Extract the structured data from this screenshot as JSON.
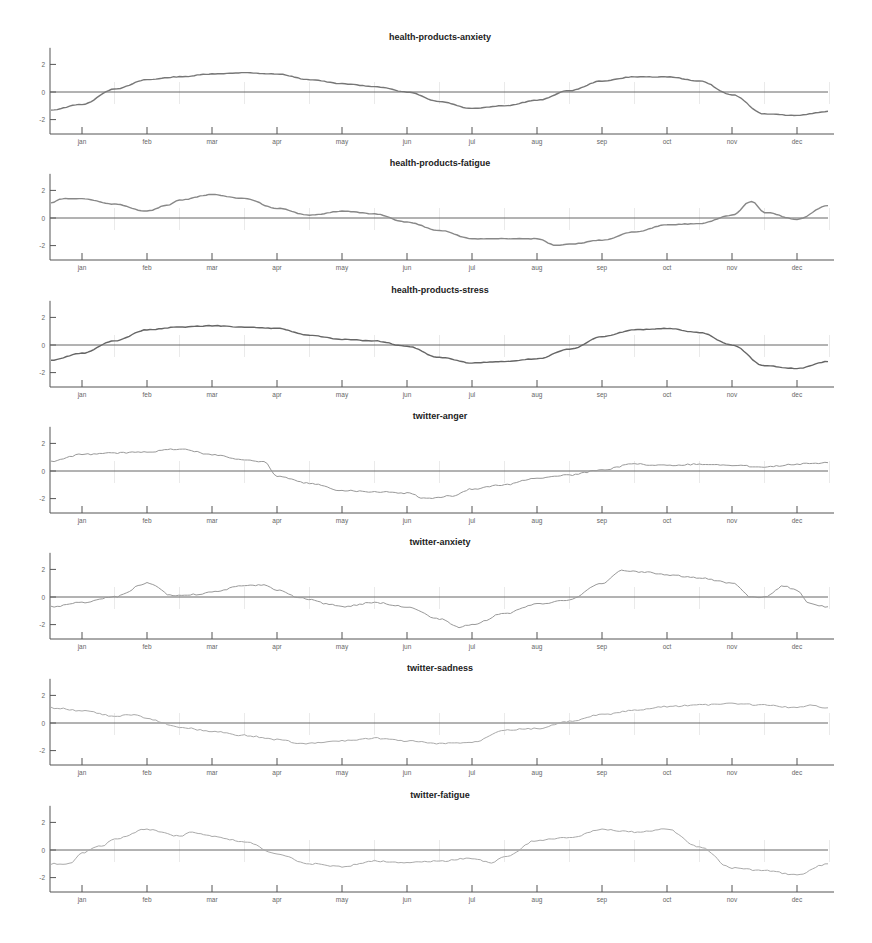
{
  "chart_data": [
    {
      "type": "line",
      "title": "health-products-anxiety",
      "xlabel": "",
      "ylabel": "",
      "ylim": [
        -3,
        3
      ],
      "yticks": [
        2,
        0,
        -2
      ],
      "categories": [
        "jan",
        "feb",
        "mar",
        "apr",
        "may",
        "jun",
        "jul",
        "aug",
        "sep",
        "oct",
        "nov",
        "dec"
      ],
      "line_color": "#777777",
      "x": [
        -0.5,
        0,
        0.5,
        1,
        1.5,
        2,
        2.5,
        3,
        3.5,
        4,
        4.5,
        5,
        5.5,
        6,
        6.5,
        7,
        7.5,
        8,
        8.5,
        9,
        9.5,
        10,
        10.5,
        11,
        11.5
      ],
      "values": [
        -1.3,
        -0.9,
        0.2,
        0.9,
        1.1,
        1.3,
        1.4,
        1.3,
        0.9,
        0.6,
        0.4,
        0.0,
        -0.7,
        -1.2,
        -1.0,
        -0.6,
        0.1,
        0.8,
        1.1,
        1.1,
        0.8,
        -0.2,
        -1.6,
        -1.7,
        -1.4
      ],
      "grid": false,
      "zero_line": true
    },
    {
      "type": "line",
      "title": "health-products-fatigue",
      "xlabel": "",
      "ylabel": "",
      "ylim": [
        -3,
        3
      ],
      "yticks": [
        2,
        0,
        -2
      ],
      "categories": [
        "jan",
        "feb",
        "mar",
        "apr",
        "may",
        "jun",
        "jul",
        "aug",
        "sep",
        "oct",
        "nov",
        "dec"
      ],
      "line_color": "#888888",
      "x": [
        -0.5,
        -0.3,
        0,
        0.5,
        1,
        1.3,
        1.5,
        2,
        2.5,
        3,
        3.5,
        4,
        4.5,
        5,
        5.5,
        6,
        6.5,
        7,
        7.3,
        7.5,
        8,
        8.5,
        9,
        9.5,
        10,
        10.3,
        10.5,
        11,
        11.5
      ],
      "values": [
        1.1,
        1.4,
        1.4,
        1.0,
        0.5,
        0.9,
        1.3,
        1.7,
        1.4,
        0.7,
        0.2,
        0.5,
        0.3,
        -0.3,
        -0.9,
        -1.5,
        -1.5,
        -1.5,
        -2.0,
        -1.9,
        -1.6,
        -1.0,
        -0.5,
        -0.4,
        0.2,
        1.2,
        0.4,
        -0.1,
        0.9
      ],
      "grid": false,
      "zero_line": true
    },
    {
      "type": "line",
      "title": "health-products-stress",
      "xlabel": "",
      "ylabel": "",
      "ylim": [
        -3,
        3
      ],
      "yticks": [
        2,
        0,
        -2
      ],
      "categories": [
        "jan",
        "feb",
        "mar",
        "apr",
        "may",
        "jun",
        "jul",
        "aug",
        "sep",
        "oct",
        "nov",
        "dec"
      ],
      "line_color": "#666666",
      "x": [
        -0.5,
        0,
        0.5,
        1,
        1.5,
        2,
        2.5,
        3,
        3.5,
        4,
        4.5,
        5,
        5.5,
        6,
        6.5,
        7,
        7.5,
        8,
        8.5,
        9,
        9.5,
        10,
        10.5,
        11,
        11.5
      ],
      "values": [
        -1.1,
        -0.6,
        0.3,
        1.1,
        1.3,
        1.4,
        1.3,
        1.2,
        0.7,
        0.4,
        0.3,
        -0.1,
        -0.9,
        -1.3,
        -1.2,
        -1.0,
        -0.3,
        0.6,
        1.1,
        1.2,
        0.9,
        0.0,
        -1.5,
        -1.7,
        -1.2
      ],
      "grid": false,
      "zero_line": true
    },
    {
      "type": "line",
      "title": "twitter-anger",
      "xlabel": "",
      "ylabel": "",
      "ylim": [
        -3,
        3
      ],
      "yticks": [
        2,
        0,
        -2
      ],
      "categories": [
        "jan",
        "feb",
        "mar",
        "apr",
        "may",
        "jun",
        "jul",
        "aug",
        "sep",
        "oct",
        "nov",
        "dec"
      ],
      "line_color": "#999999",
      "x": [
        -0.5,
        0,
        0.5,
        1,
        1.5,
        2,
        2.5,
        2.8,
        3,
        3.5,
        4,
        4.5,
        5,
        5.3,
        5.7,
        6,
        6.5,
        7,
        7.5,
        8,
        8.5,
        9,
        9.5,
        10,
        10.5,
        11,
        11.5
      ],
      "values": [
        0.7,
        1.2,
        1.3,
        1.4,
        1.6,
        1.2,
        0.8,
        0.7,
        -0.4,
        -0.9,
        -1.4,
        -1.5,
        -1.6,
        -2.0,
        -1.8,
        -1.3,
        -1.0,
        -0.5,
        -0.3,
        0.1,
        0.5,
        0.4,
        0.5,
        0.4,
        0.3,
        0.5,
        0.6
      ],
      "grid": false,
      "zero_line": true
    },
    {
      "type": "line",
      "title": "twitter-anxiety",
      "xlabel": "",
      "ylabel": "",
      "ylim": [
        -3,
        3
      ],
      "yticks": [
        2,
        0,
        -2
      ],
      "categories": [
        "jan",
        "feb",
        "mar",
        "apr",
        "may",
        "jun",
        "jul",
        "aug",
        "sep",
        "oct",
        "nov",
        "dec"
      ],
      "line_color": "#999999",
      "x": [
        -0.5,
        0,
        0.5,
        1,
        1.4,
        1.8,
        2,
        2.5,
        2.8,
        3,
        3.4,
        3.8,
        4,
        4.5,
        5,
        5.5,
        5.8,
        6,
        6.5,
        7,
        7.5,
        8,
        8.3,
        8.7,
        9,
        9.5,
        10,
        10.3,
        10.5,
        10.8,
        11,
        11.2,
        11.5
      ],
      "values": [
        -0.7,
        -0.4,
        0.0,
        1.0,
        0.1,
        0.2,
        0.4,
        0.8,
        0.9,
        0.5,
        -0.1,
        -0.5,
        -0.7,
        -0.4,
        -0.7,
        -1.6,
        -2.2,
        -2.0,
        -1.2,
        -0.5,
        -0.2,
        1.0,
        1.9,
        1.8,
        1.6,
        1.4,
        1.0,
        0.0,
        0.0,
        0.8,
        0.5,
        -0.5,
        -0.7
      ],
      "grid": false,
      "zero_line": true
    },
    {
      "type": "line",
      "title": "twitter-sadness",
      "xlabel": "",
      "ylabel": "",
      "ylim": [
        -3,
        3
      ],
      "yticks": [
        2,
        0,
        -2
      ],
      "categories": [
        "jan",
        "feb",
        "mar",
        "apr",
        "may",
        "jun",
        "jul",
        "aug",
        "sep",
        "oct",
        "nov",
        "dec"
      ],
      "line_color": "#aaaaaa",
      "x": [
        -0.5,
        0,
        0.5,
        0.8,
        1,
        1.5,
        2,
        2.5,
        3,
        3.4,
        4,
        4.5,
        5,
        5.5,
        6,
        6.5,
        7,
        7.5,
        8,
        8.5,
        9,
        9.5,
        10,
        10.5,
        11,
        11.2,
        11.5
      ],
      "values": [
        1.1,
        0.9,
        0.5,
        0.6,
        0.3,
        -0.3,
        -0.6,
        -0.9,
        -1.2,
        -1.5,
        -1.3,
        -1.1,
        -1.3,
        -1.5,
        -1.4,
        -0.5,
        -0.4,
        0.1,
        0.6,
        0.9,
        1.2,
        1.3,
        1.4,
        1.3,
        1.1,
        1.3,
        1.1
      ],
      "grid": false,
      "zero_line": true
    },
    {
      "type": "line",
      "title": "twitter-fatigue",
      "xlabel": "",
      "ylabel": "",
      "ylim": [
        -3,
        3
      ],
      "yticks": [
        2,
        0,
        -2
      ],
      "categories": [
        "jan",
        "feb",
        "mar",
        "apr",
        "may",
        "jun",
        "jul",
        "aug",
        "sep",
        "oct",
        "nov",
        "dec"
      ],
      "line_color": "#aaaaaa",
      "x": [
        -0.5,
        -0.2,
        0,
        0.3,
        0.5,
        1,
        1.5,
        1.7,
        2,
        2.5,
        3,
        3.5,
        4,
        4.5,
        5,
        5.5,
        6,
        6.3,
        6.5,
        7,
        7.5,
        8,
        8.5,
        9,
        9.5,
        10,
        10.5,
        11,
        11.5
      ],
      "values": [
        -1.0,
        -1.0,
        -0.2,
        0.3,
        0.8,
        1.5,
        1.0,
        1.3,
        1.0,
        0.6,
        -0.3,
        -1.0,
        -1.2,
        -0.8,
        -0.9,
        -0.8,
        -0.6,
        -0.9,
        -0.5,
        0.7,
        0.9,
        1.5,
        1.3,
        1.5,
        0.2,
        -1.3,
        -1.5,
        -1.8,
        -1.0
      ],
      "grid": false,
      "zero_line": true
    }
  ],
  "layout": {
    "plot_left": 50,
    "plot_right": 834,
    "x_first_month": 82,
    "month_spacing": 65.0,
    "panel_zero_y": [
      92,
      218,
      345,
      471,
      597,
      723,
      850
    ],
    "unit_px": 13.8,
    "title_offset": -52,
    "axis_color": "#555555",
    "zero_line_color": "#666666"
  }
}
